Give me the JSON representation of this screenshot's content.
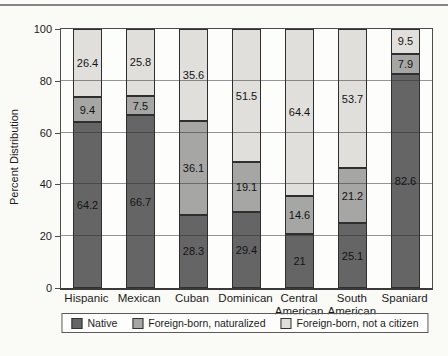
{
  "figure": {
    "ylabel": "Percent Distribution"
  },
  "chart_data": {
    "type": "bar",
    "stacked": true,
    "title": "",
    "xlabel": "",
    "ylabel": "Percent Distribution",
    "ylim": [
      0,
      100
    ],
    "yticks": [
      0,
      20,
      40,
      60,
      80,
      100
    ],
    "grid": true,
    "gridlines_over_bars": true,
    "legend_position": "bottom",
    "categories": [
      "Hispanic",
      "Mexican",
      "Cuban",
      "Dominican",
      "Central American",
      "South American",
      "Spaniard"
    ],
    "series": [
      {
        "name": "Native",
        "color": "#656565",
        "values": [
          64.2,
          66.7,
          28.3,
          29.4,
          21,
          25.1,
          82.6
        ]
      },
      {
        "name": "Foreign-born, naturalized",
        "color": "#a6a6a4",
        "values": [
          9.4,
          7.5,
          36.1,
          19.1,
          14.6,
          21.2,
          7.9
        ]
      },
      {
        "name": "Foreign-born, not a citizen",
        "color": "#e0dfdb",
        "values": [
          26.4,
          25.8,
          35.6,
          51.5,
          64.4,
          53.7,
          9.5
        ]
      }
    ]
  }
}
